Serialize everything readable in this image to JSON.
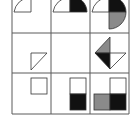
{
  "puzzle": {
    "type": "3x3 figure-reasoning matrix",
    "colors": {
      "line": "#5a5a5a",
      "black": "#111111",
      "gray": "#8a8a8a",
      "white": "#ffffff"
    },
    "grid": {
      "cols_x": [
        12,
        51,
        90,
        129
      ],
      "rows_y": [
        -5,
        33,
        73,
        114
      ]
    },
    "cells": [
      {
        "row": 0,
        "col": 0,
        "description": "white quarter-circle (top-left)"
      },
      {
        "row": 0,
        "col": 1,
        "description": "white quarter-circle plus black quarter-circle to the right forming a half-circle"
      },
      {
        "row": 0,
        "col": 2,
        "description": "white quarter, black quarter top-right, gray quarter bottom-right"
      },
      {
        "row": 1,
        "col": 0,
        "description": "white right triangle"
      },
      {
        "row": 1,
        "col": 1,
        "description": "empty"
      },
      {
        "row": 1,
        "col": 2,
        "description": "diamond of triangles: gray top-left, black bottom-left, white bottom-right"
      },
      {
        "row": 2,
        "col": 0,
        "description": "white square"
      },
      {
        "row": 2,
        "col": 1,
        "description": "white square above black square"
      },
      {
        "row": 2,
        "col": 2,
        "description": "white square top-right, gray bottom-left, black bottom-right"
      }
    ]
  }
}
